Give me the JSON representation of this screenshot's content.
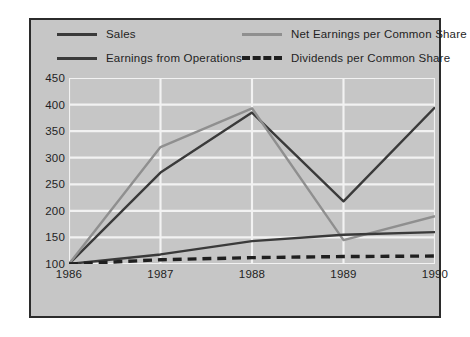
{
  "chart_data": {
    "type": "line",
    "title": "",
    "subtitle": "",
    "xlabel": "",
    "ylabel": "",
    "categories": [
      "1986",
      "1987",
      "1988",
      "1989",
      "1990"
    ],
    "x": [
      1986,
      1987,
      1988,
      1989,
      1990
    ],
    "ylim": [
      100,
      450
    ],
    "yticks": [
      100,
      150,
      200,
      250,
      300,
      350,
      400,
      450
    ],
    "grid": true,
    "legend_position": "top",
    "series": [
      {
        "name": "Sales",
        "values": [
          100,
          272,
          385,
          218,
          395
        ],
        "color": "#3a3a3a",
        "style": "solid"
      },
      {
        "name": "Net Earnings per Common Share",
        "values": [
          100,
          320,
          393,
          145,
          190
        ],
        "color": "#8f8f8f",
        "style": "solid"
      },
      {
        "name": "Earnings from Operations",
        "values": [
          100,
          118,
          143,
          155,
          160
        ],
        "color": "#3a3a3a",
        "style": "solid"
      },
      {
        "name": "Dividends per Common Share",
        "values": [
          100,
          108,
          112,
          114,
          115
        ],
        "color": "#1f1f1f",
        "style": "dashed"
      }
    ]
  },
  "legend": {
    "items": [
      {
        "label": "Sales",
        "swatch": "solid-dark"
      },
      {
        "label": "Net Earnings per Common Share",
        "swatch": "solid-gray"
      },
      {
        "label": "Earnings from Operations",
        "swatch": "solid-dark"
      },
      {
        "label": "Dividends per Common Share",
        "swatch": "dashed-dark"
      }
    ]
  },
  "colors": {
    "figure_background": "#c6c6c6",
    "figure_border": "#2b2b2b",
    "gridline": "#f2f2f2",
    "axis": "#ffffff",
    "text": "#1f1f1f",
    "page_background": "#ffffff"
  }
}
